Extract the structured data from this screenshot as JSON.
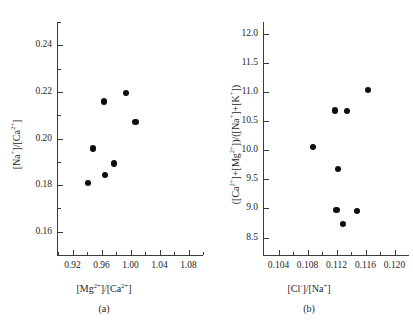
{
  "figure": {
    "panels": [
      {
        "caption": "(a)",
        "xlabel_html": "[Mg<sup>2+</sup>]/[Ca<sup>2+</sup>]",
        "ylabel_html": "[Na<sup>+</sup>]/[Ca<sup>2+</sup>]"
      },
      {
        "caption": "(b)",
        "xlabel_html": "[Cl<sup>-</sup>]/[Na<sup>+</sup>]",
        "ylabel_html": "([Ca<sup>2+</sup>]+[Mg<sup>2+</sup>])/([Na<sup>+</sup>]+[K<sup>+</sup>])"
      }
    ]
  },
  "chart_data": [
    {
      "type": "scatter",
      "panel": "(a)",
      "title": "",
      "xlabel": "[Mg2+]/[Ca2+]",
      "ylabel": "[Na+]/[Ca2+]",
      "xlim": [
        0.9,
        1.1
      ],
      "ylim": [
        0.15,
        0.25
      ],
      "xticks": [
        0.92,
        0.96,
        1.0,
        1.04,
        1.08
      ],
      "xticklabels": [
        "0.92",
        "0.96",
        "1.00",
        "1.04",
        "1.08"
      ],
      "xminorticks": [
        0.9,
        0.94,
        0.98,
        1.02,
        1.06,
        1.1
      ],
      "yticks": [
        0.16,
        0.18,
        0.2,
        0.22,
        0.24
      ],
      "yticklabels": [
        "0.16",
        "0.18",
        "0.20",
        "0.22",
        "0.24"
      ],
      "yminorticks": [
        0.15,
        0.17,
        0.19,
        0.21,
        0.23,
        0.25
      ],
      "grid": false,
      "legend": null,
      "marker": "filled-circle",
      "color": "#0d0d0d",
      "points": [
        {
          "x": 0.941,
          "y": 0.1808
        },
        {
          "x": 0.948,
          "y": 0.1957
        },
        {
          "x": 0.965,
          "y": 0.1843
        },
        {
          "x": 0.963,
          "y": 0.2159
        },
        {
          "x": 0.977,
          "y": 0.1893
        },
        {
          "x": 0.994,
          "y": 0.2195
        },
        {
          "x": 1.007,
          "y": 0.207
        }
      ]
    },
    {
      "type": "scatter",
      "panel": "(b)",
      "title": "",
      "xlabel": "[Cl-]/[Na+]",
      "ylabel": "([Ca2+]+[Mg2+])/([Na+]+[K+])",
      "xlim": [
        0.102,
        0.122
      ],
      "ylim": [
        8.2,
        12.2
      ],
      "xticks": [
        0.104,
        0.108,
        0.112,
        0.116,
        0.12
      ],
      "xticklabels": [
        "0.104",
        "0.108",
        "0.112",
        "0.116",
        "0.120"
      ],
      "xminorticks": [
        0.106,
        0.11,
        0.114,
        0.118
      ],
      "yticks": [
        8.5,
        9.0,
        9.5,
        10.0,
        10.5,
        11.0,
        11.5,
        12.0
      ],
      "yticklabels": [
        "8.5",
        "9.0",
        "9.5",
        "10.0",
        "10.5",
        "11.0",
        "11.5",
        "12.0"
      ],
      "grid": false,
      "legend": null,
      "marker": "filled-circle",
      "color": "#0d0d0d",
      "points": [
        {
          "x": 0.1088,
          "y": 10.05
        },
        {
          "x": 0.1118,
          "y": 10.68
        },
        {
          "x": 0.1135,
          "y": 10.67
        },
        {
          "x": 0.1163,
          "y": 11.03
        },
        {
          "x": 0.1122,
          "y": 9.67
        },
        {
          "x": 0.112,
          "y": 8.97
        },
        {
          "x": 0.1129,
          "y": 8.73
        },
        {
          "x": 0.1148,
          "y": 8.95
        }
      ]
    }
  ]
}
